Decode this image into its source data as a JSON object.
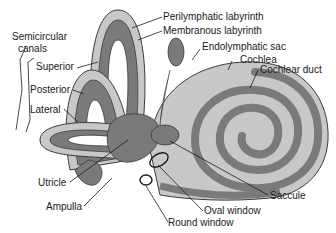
{
  "diagram": {
    "colors": {
      "perilymphatic": "#c8c8c8",
      "membranous": "#7a7a7a",
      "outline": "#3a3a3a",
      "text": "#1a1a1a"
    },
    "labels": {
      "semicircular_canals_line1": "Semicircular",
      "semicircular_canals_line2": "canals",
      "superior": "Superior",
      "posterior": "Posterior",
      "lateral": "Lateral",
      "perilymphatic_labyrinth": "Perilymphatic labyrinth",
      "membranous_labyrinth": "Membranous labyrinth",
      "endolymphatic_sac": "Endolymphatic sac",
      "cochlea": "Cochlea",
      "cochlear_duct": "Cochlear duct",
      "utricle": "Utricle",
      "ampulla": "Ampulla",
      "saccule": "Saccule",
      "oval_window": "Oval window",
      "round_window": "Round window"
    }
  }
}
